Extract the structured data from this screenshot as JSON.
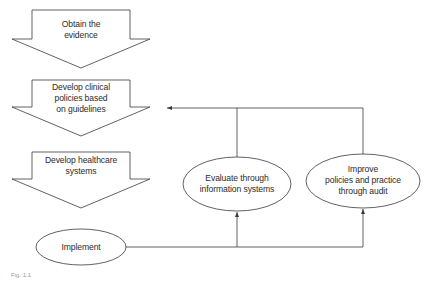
{
  "diagram": {
    "type": "flowchart",
    "nodes": [
      {
        "id": "obtain",
        "shape": "down-arrow",
        "label": "Obtain the\nevidence"
      },
      {
        "id": "develop_policies",
        "shape": "down-arrow",
        "label": "Develop clinical\npolicies based\non guidelines"
      },
      {
        "id": "develop_systems",
        "shape": "down-arrow",
        "label": "Develop healthcare\nsystems"
      },
      {
        "id": "implement",
        "shape": "ellipse",
        "label": "Implement"
      },
      {
        "id": "evaluate",
        "shape": "ellipse",
        "label": "Evaluate through\ninformation systems"
      },
      {
        "id": "improve",
        "shape": "ellipse",
        "label": "Improve\npolicies and practice\nthrough audit"
      }
    ],
    "edges": [
      {
        "from": "obtain",
        "to": "develop_policies"
      },
      {
        "from": "develop_policies",
        "to": "develop_systems"
      },
      {
        "from": "develop_systems",
        "to": "implement"
      },
      {
        "from": "implement",
        "to": "evaluate"
      },
      {
        "from": "implement",
        "to": "improve"
      },
      {
        "from": "evaluate",
        "to": "develop_policies"
      },
      {
        "from": "improve",
        "to": "develop_policies"
      }
    ],
    "caption": "Fig. 1.1"
  },
  "colors": {
    "stroke": "#3a3a3a",
    "text": "#2b2b2b",
    "background": "#ffffff"
  }
}
